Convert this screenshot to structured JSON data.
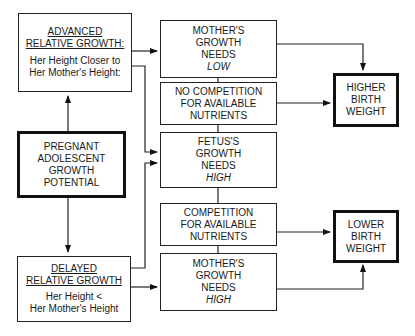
{
  "boxes": {
    "advanced": {
      "title1": "ADVANCED",
      "title2": "RELATIVE GROWTH:",
      "line1": "Her Height Closer to",
      "line2": "Her Mother's Height:"
    },
    "potential": {
      "line1": "PREGNANT",
      "line2": "ADOLESCENT",
      "line3": "GROWTH",
      "line4": "POTENTIAL"
    },
    "delayed": {
      "title1": "DELAYED",
      "title2": "RELATIVE GROWTH",
      "line1": "Her Height <",
      "line2": "Her Mother's Height"
    },
    "mother_low": {
      "line1": "MOTHER'S",
      "line2": "GROWTH",
      "line3": "NEEDS",
      "level": "LOW"
    },
    "no_competition": {
      "line1": "NO COMPETITION",
      "line2": "FOR AVAILABLE",
      "line3": "NUTRIENTS"
    },
    "fetus": {
      "line1": "FETUS'S",
      "line2": "GROWTH",
      "line3": "NEEDS",
      "level": "HIGH"
    },
    "competition": {
      "line1": "COMPETITION",
      "line2": "FOR AVAILABLE",
      "line3": "NUTRIENTS"
    },
    "mother_high": {
      "line1": "MOTHER'S",
      "line2": "GROWTH",
      "line3": "NEEDS",
      "level": "HIGH"
    },
    "higher": {
      "line1": "HIGHER",
      "line2": "BIRTH",
      "line3": "WEIGHT"
    },
    "lower": {
      "line1": "LOWER",
      "line2": "BIRTH",
      "line3": "WEIGHT"
    }
  }
}
